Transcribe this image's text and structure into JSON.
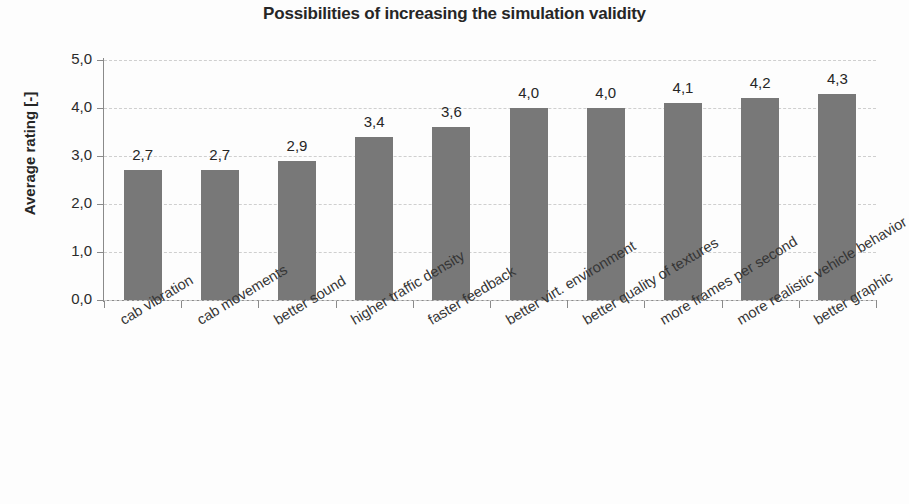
{
  "chart_data": {
    "type": "bar",
    "title": "Possibilities of increasing the simulation validity",
    "xlabel": "",
    "ylabel": "Average rating [-]",
    "ylim": [
      0,
      5
    ],
    "grid": true,
    "legend": "none",
    "decimal_separator": ",",
    "bar_color": "#787878",
    "categories": [
      "cab vibration",
      "cab movements",
      "better sound",
      "higher traffic density",
      "faster feedback",
      "better virt. environment",
      "better quality of textures",
      "more frames per second",
      "more realistic vehicle behavior",
      "better graphic"
    ],
    "values": [
      2.7,
      2.7,
      2.9,
      3.4,
      3.6,
      4.0,
      4.0,
      4.1,
      4.2,
      4.3
    ],
    "value_labels": [
      "2,7",
      "2,7",
      "2,9",
      "3,4",
      "3,6",
      "4,0",
      "4,0",
      "4,1",
      "4,2",
      "4,3"
    ],
    "y_ticks": [
      0,
      1,
      2,
      3,
      4,
      5
    ],
    "y_tick_labels": [
      "0,0",
      "1,0",
      "2,0",
      "3,0",
      "4,0",
      "5,0"
    ]
  }
}
